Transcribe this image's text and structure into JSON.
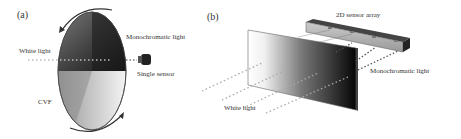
{
  "panel_a": {
    "label": "(a)",
    "white_light": "White light",
    "monochromatic_light": "Monochromatic light",
    "single_sensor": "Single sensor",
    "cvf": "CVF"
  },
  "panel_b": {
    "label": "(b)",
    "sensor_array": "2D sensor array",
    "monochromatic_light": "Monochromatic light",
    "white_light": "White light"
  }
}
